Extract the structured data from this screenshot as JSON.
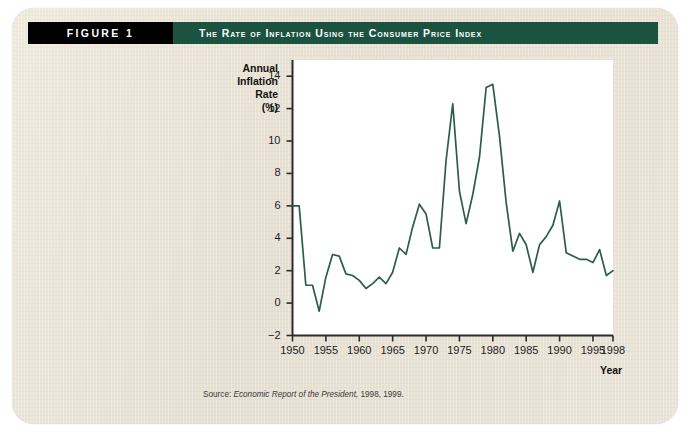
{
  "figure": {
    "label": "FIGURE 1",
    "title": "The Rate of Inflation Using the Consumer Price Index",
    "source_prefix": "Source:",
    "source_italic": "Economic Report of the President,",
    "source_suffix": "1998, 1999."
  },
  "colors": {
    "banner_black": "#000000",
    "banner_green": "#1c5340",
    "line": "#2c5c4f",
    "page": "#e9e3d6",
    "plot": "#ffffff"
  },
  "chart_data": {
    "type": "line",
    "title": "The Rate of Inflation Using the Consumer Price Index",
    "xlabel": "Year",
    "ylabel": "Annual Inflation Rate (%)",
    "ylabel_lines": [
      "Annual",
      "Inflation",
      "Rate",
      "(%)"
    ],
    "xlim": [
      1950,
      1998
    ],
    "ylim": [
      -2,
      15
    ],
    "grid": false,
    "legend": "none",
    "yticks": [
      -2,
      0,
      2,
      4,
      6,
      8,
      10,
      12,
      14
    ],
    "ytick_labels": [
      "−2",
      "0",
      "2",
      "4",
      "6",
      "8",
      "10",
      "12",
      "14"
    ],
    "xticks": [
      1950,
      1955,
      1960,
      1965,
      1970,
      1975,
      1980,
      1985,
      1990,
      1995,
      1998
    ],
    "xtick_labels": [
      "1950",
      "1955",
      "1960",
      "1965",
      "1970",
      "1975",
      "1980",
      "1985",
      "1990",
      "1995",
      "1998"
    ],
    "x": [
      1950,
      1951,
      1952,
      1953,
      1954,
      1955,
      1956,
      1957,
      1958,
      1959,
      1960,
      1961,
      1962,
      1963,
      1964,
      1965,
      1966,
      1967,
      1968,
      1969,
      1970,
      1971,
      1972,
      1973,
      1974,
      1975,
      1976,
      1977,
      1978,
      1979,
      1980,
      1981,
      1982,
      1983,
      1984,
      1985,
      1986,
      1987,
      1988,
      1989,
      1990,
      1991,
      1992,
      1993,
      1994,
      1995,
      1996,
      1997,
      1998
    ],
    "values": [
      6.0,
      6.0,
      1.1,
      1.1,
      -0.5,
      1.6,
      3.0,
      2.9,
      1.8,
      1.7,
      1.4,
      0.9,
      1.2,
      1.6,
      1.2,
      1.9,
      3.4,
      3.0,
      4.7,
      6.1,
      5.5,
      3.4,
      3.4,
      8.8,
      12.3,
      6.9,
      4.9,
      6.7,
      9.0,
      13.3,
      13.5,
      10.3,
      6.2,
      3.2,
      4.3,
      3.6,
      1.9,
      3.6,
      4.1,
      4.8,
      6.3,
      3.1,
      2.9,
      2.7,
      2.7,
      2.5,
      3.3,
      1.7,
      2.0
    ],
    "series": [
      {
        "name": "Annual Inflation Rate (%)",
        "values": [
          6.0,
          6.0,
          1.1,
          1.1,
          -0.5,
          1.6,
          3.0,
          2.9,
          1.8,
          1.7,
          1.4,
          0.9,
          1.2,
          1.6,
          1.2,
          1.9,
          3.4,
          3.0,
          4.7,
          6.1,
          5.5,
          3.4,
          3.4,
          8.8,
          12.3,
          6.9,
          4.9,
          6.7,
          9.0,
          13.3,
          13.5,
          10.3,
          6.2,
          3.2,
          4.3,
          3.6,
          1.9,
          3.6,
          4.1,
          4.8,
          6.3,
          3.1,
          2.9,
          2.7,
          2.7,
          2.5,
          3.3,
          1.7,
          2.0
        ]
      }
    ]
  }
}
